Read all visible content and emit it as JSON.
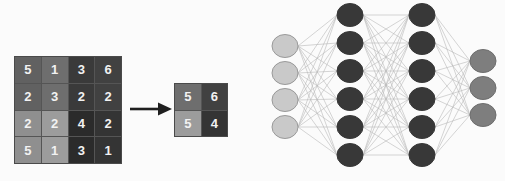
{
  "figure": {
    "background_color": "#fbfbfb",
    "title": ""
  },
  "input_matrix": {
    "name": "input-feature-map",
    "rows": 4,
    "cols": 4,
    "border_color": "#4a4a4a",
    "grid_line_color": "#555555",
    "text_color": "#f2f2f2",
    "values": [
      [
        5,
        1,
        3,
        6
      ],
      [
        2,
        3,
        2,
        2
      ],
      [
        2,
        2,
        4,
        2
      ],
      [
        5,
        1,
        3,
        1
      ]
    ],
    "cell_colors": [
      [
        "#616161",
        "#6e6e6e",
        "#3a3a3a",
        "#414141"
      ],
      [
        "#616161",
        "#6e6e6e",
        "#3a3a3a",
        "#414141"
      ],
      [
        "#8f8f8f",
        "#9c9c9c",
        "#2b2b2b",
        "#343434"
      ],
      [
        "#8f8f8f",
        "#9c9c9c",
        "#2b2b2b",
        "#343434"
      ]
    ]
  },
  "arrow": {
    "name": "transform-arrow",
    "color": "#1f1f1f",
    "direction": "right"
  },
  "output_matrix": {
    "name": "pooled-feature-map",
    "rows": 2,
    "cols": 2,
    "border_color": "#4a4a4a",
    "grid_line_color": "#555555",
    "text_color": "#f2f2f2",
    "values": [
      [
        5,
        6
      ],
      [
        5,
        4
      ]
    ],
    "cell_colors": [
      [
        "#6e6e6e",
        "#414141"
      ],
      [
        "#9c9c9c",
        "#343434"
      ]
    ]
  },
  "neural_network": {
    "name": "fully-connected-network",
    "connection_color": "#b9b9b9",
    "connection_width": 0.6,
    "node_radius_x": 13,
    "node_radius_y": 11.5,
    "layers": [
      {
        "name": "input-layer",
        "node_count": 4,
        "fill": "#c9c9c9",
        "stroke": "#9a9a9a",
        "x": 35,
        "ys": [
          46,
          73,
          100,
          127
        ]
      },
      {
        "name": "hidden-layer-1",
        "node_count": 6,
        "fill": "#383838",
        "stroke": "#383838",
        "x": 100,
        "ys": [
          15,
          43,
          71,
          99,
          127,
          155
        ]
      },
      {
        "name": "hidden-layer-2",
        "node_count": 6,
        "fill": "#383838",
        "stroke": "#383838",
        "x": 172,
        "ys": [
          15,
          43,
          71,
          99,
          127,
          155
        ]
      },
      {
        "name": "output-layer",
        "node_count": 3,
        "fill": "#7e7e7e",
        "stroke": "#6e6e6e",
        "x": 233,
        "ys": [
          61,
          88,
          115
        ]
      }
    ]
  }
}
